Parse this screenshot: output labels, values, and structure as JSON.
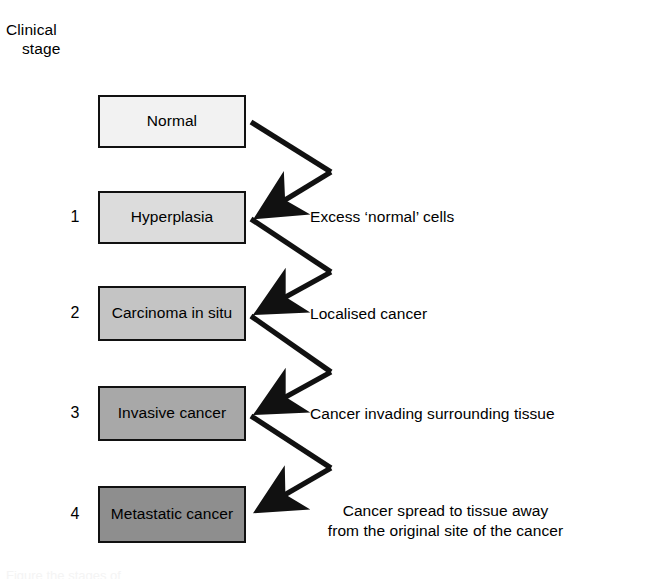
{
  "figure": {
    "axis_title_line1": "Clinical",
    "axis_title_line2": "stage",
    "caption_cut_off": "Figure  the stages of"
  },
  "stages": [
    {
      "number": "",
      "label": "Normal",
      "fill": "#f2f2f2",
      "top": 95,
      "height": 53,
      "annotation": ""
    },
    {
      "number": "1",
      "label": "Hyperplasia",
      "fill": "#dcdcdc",
      "top": 191,
      "height": 53,
      "annotation": "Excess ‘normal’ cells"
    },
    {
      "number": "2",
      "label": "Carcinoma in\nsitu",
      "fill": "#c4c4c4",
      "top": 286,
      "height": 55,
      "annotation": "Localised cancer"
    },
    {
      "number": "3",
      "label": "Invasive\ncancer",
      "fill": "#a8a8a8",
      "top": 386,
      "height": 55,
      "annotation": "Cancer invading surrounding tissue"
    },
    {
      "number": "4",
      "label": "Metastatic\ncancer",
      "fill": "#8e8e8e",
      "top": 486,
      "height": 57,
      "annotation": "Cancer spread to tissue away\nfrom the original site of the cancer"
    }
  ],
  "arrows": [
    {
      "from_stage": "Normal",
      "to_stage": "Hyperplasia"
    },
    {
      "from_stage": "Hyperplasia",
      "to_stage": "Carcinoma in situ"
    },
    {
      "from_stage": "Carcinoma in situ",
      "to_stage": "Invasive cancer"
    },
    {
      "from_stage": "Invasive cancer",
      "to_stage": "Metastatic cancer"
    }
  ],
  "colors": {
    "stroke": "#111111",
    "background": "#ffffff",
    "text": "#000000"
  }
}
